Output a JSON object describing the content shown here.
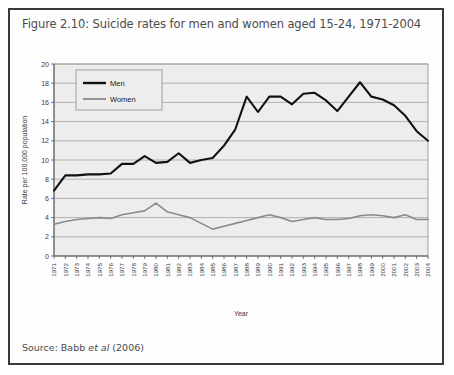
{
  "figure": {
    "title": "Figure 2.10: Suicide rates for men and women aged 15-24, 1971-2004",
    "source_prefix": "Source: Babb ",
    "source_italic": "et al",
    "source_suffix": " (2006)"
  },
  "chart_data": {
    "type": "line",
    "title": "",
    "xlabel": "Year",
    "ylabel": "Rate per 100,000 population",
    "ylim": [
      0,
      20
    ],
    "ytick_step": 2,
    "yticks": [
      0,
      2,
      4,
      6,
      8,
      10,
      12,
      14,
      16,
      18,
      20
    ],
    "grid": true,
    "legend_position": "top-left",
    "categories": [
      "1971",
      "1972",
      "1973",
      "1974",
      "1975",
      "1976",
      "1977",
      "1978",
      "1979",
      "1980",
      "1981",
      "1982",
      "1983",
      "1984",
      "1985",
      "1986",
      "1987",
      "1988",
      "1989",
      "1990",
      "1991",
      "1992",
      "1993",
      "1994",
      "1995",
      "1996",
      "1997",
      "1998",
      "1999",
      "2000",
      "2001",
      "2002",
      "2003",
      "2004"
    ],
    "series": [
      {
        "name": "Men",
        "color": "#111111",
        "values": [
          6.8,
          8.4,
          8.4,
          8.5,
          8.5,
          8.6,
          9.6,
          9.6,
          10.4,
          9.7,
          9.8,
          10.7,
          9.7,
          10.0,
          10.2,
          11.5,
          13.2,
          16.6,
          15.0,
          16.6,
          16.6,
          15.8,
          16.9,
          17.0,
          16.2,
          15.1,
          16.6,
          18.1,
          16.6,
          16.3,
          15.7,
          14.6,
          13.0,
          12.0
        ]
      },
      {
        "name": "Women",
        "color": "#8a8a8a",
        "values": [
          3.3,
          3.6,
          3.8,
          3.9,
          4.0,
          3.9,
          4.3,
          4.5,
          4.7,
          5.5,
          4.6,
          4.3,
          4.0,
          3.4,
          2.8,
          3.1,
          3.4,
          3.7,
          4.0,
          4.3,
          4.0,
          3.6,
          3.8,
          4.0,
          3.8,
          3.8,
          3.9,
          4.2,
          4.3,
          4.2,
          4.0,
          4.3,
          3.8,
          3.8
        ]
      }
    ]
  }
}
